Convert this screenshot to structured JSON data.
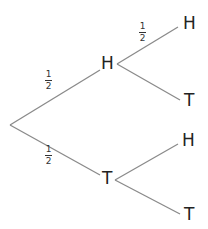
{
  "diagram": {
    "type": "probability-tree",
    "line_color": "#8a8a8a",
    "nodes": {
      "first_H": "H",
      "first_T": "T",
      "H_H": "H",
      "H_T": "T",
      "T_H": "H",
      "T_T": "T"
    },
    "labels": {
      "root_to_H": {
        "num": "1",
        "den": "2"
      },
      "root_to_T": {
        "num": "1",
        "den": "2"
      },
      "H_to_H": {
        "num": "1",
        "den": "2"
      }
    }
  }
}
